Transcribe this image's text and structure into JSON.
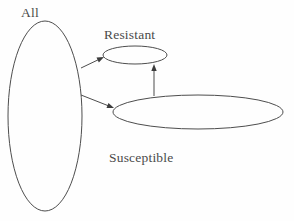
{
  "diagram": {
    "background_color": "#fefefe",
    "stroke_color": "#4d4d4d",
    "text_color": "#4a4a4a",
    "labels": {
      "all": "All",
      "resistant": "Resistant",
      "susceptible": "Susceptible"
    },
    "nodes": [
      {
        "id": "all",
        "label": "All",
        "shape": "ellipse",
        "cx": 45,
        "cy": 116,
        "rx": 37,
        "ry": 95,
        "label_position": "above-left"
      },
      {
        "id": "resistant",
        "label": "Resistant",
        "shape": "ellipse",
        "cx": 135,
        "cy": 55,
        "rx": 32,
        "ry": 9,
        "label_position": "above"
      },
      {
        "id": "susceptible",
        "label": "Susceptible",
        "shape": "ellipse",
        "cx": 198,
        "cy": 112,
        "rx": 85,
        "ry": 17,
        "label_position": "below-left"
      }
    ],
    "edges": [
      {
        "id": "all-to-resistant",
        "from": "all",
        "to": "resistant",
        "arrowhead": "end",
        "x1": 81,
        "y1": 68,
        "x2": 104,
        "y2": 57
      },
      {
        "id": "all-to-susceptible",
        "from": "all",
        "to": "susceptible",
        "arrowhead": "end",
        "x1": 81,
        "y1": 95,
        "x2": 114,
        "y2": 108
      },
      {
        "id": "susceptible-to-resistant",
        "from": "susceptible",
        "to": "resistant",
        "arrowhead": "end",
        "x1": 154,
        "y1": 96,
        "x2": 154,
        "y2": 64
      }
    ]
  }
}
